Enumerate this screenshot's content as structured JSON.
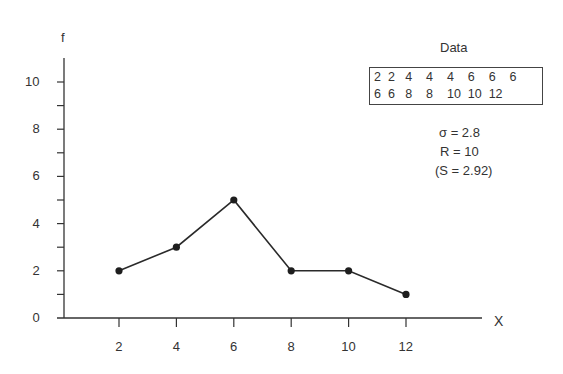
{
  "chart_data": {
    "type": "line",
    "title": "",
    "xlabel": "X",
    "ylabel": "f",
    "x": [
      2,
      4,
      6,
      8,
      10,
      12
    ],
    "series": [
      {
        "name": "frequency",
        "values": [
          2,
          3,
          5,
          2,
          2,
          1
        ]
      }
    ],
    "x_ticks": [
      2,
      4,
      6,
      8,
      10,
      12
    ],
    "y_ticks": [
      0,
      2,
      4,
      6,
      8,
      10
    ],
    "y_minor_ticks": [
      1,
      3,
      5,
      7,
      9
    ],
    "xlim": [
      0,
      14.5
    ],
    "ylim": [
      0,
      11.2
    ],
    "grid": false,
    "legend": null,
    "markers": true,
    "annotations": {
      "data_title": "Data",
      "data_values_row1": [
        "2",
        "2",
        "4",
        "4",
        "4",
        "6",
        "6",
        "6"
      ],
      "data_values_row2": [
        "6",
        "6",
        "8",
        "8",
        "10",
        "10",
        "12"
      ],
      "sigma": "σ = 2.8",
      "range": "R = 10",
      "sample_sd": "(S = 2.92)"
    }
  },
  "labels": {
    "y_axis": "f",
    "x_axis": "X",
    "y_ticks": [
      "0",
      "2",
      "4",
      "6",
      "8",
      "10"
    ],
    "x_ticks": [
      "2",
      "4",
      "6",
      "8",
      "10",
      "12"
    ]
  },
  "data_box": {
    "title": "Data",
    "row1": "2  2   4    4    4    6    6    6",
    "row2": "6  6   8    8    10  10  12"
  },
  "stats": {
    "sigma": "σ = 2.8",
    "range": "R = 10",
    "sample_sd": "(S = 2.92)"
  }
}
